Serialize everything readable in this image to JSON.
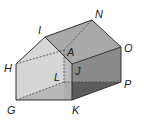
{
  "figure": {
    "vertices": {
      "I": {
        "label": "I",
        "x": 45,
        "y": 37
      },
      "H": {
        "label": "H",
        "x": 16,
        "y": 64
      },
      "G": {
        "label": "G",
        "x": 16,
        "y": 100
      },
      "K": {
        "label": "K",
        "x": 72,
        "y": 100
      },
      "E": {
        "label": "",
        "x": 72,
        "y": 64
      },
      "N": {
        "label": "N",
        "x": 92,
        "y": 20
      },
      "O": {
        "label": "O",
        "x": 121,
        "y": 47
      },
      "P": {
        "label": "P",
        "x": 121,
        "y": 82
      },
      "A": {
        "label": "A",
        "x": 64,
        "y": 50
      },
      "L": {
        "label": "L",
        "x": 64,
        "y": 82
      },
      "J": {
        "label": "J"
      }
    },
    "colors": {
      "front_face": "#d6d6d6",
      "roof_left": "#c9c9c9",
      "roof_right": "#a6a6a6",
      "side_face": "#8a8a8a",
      "bottom_shadow": "#5a5a5a",
      "edge": "#333333"
    }
  }
}
